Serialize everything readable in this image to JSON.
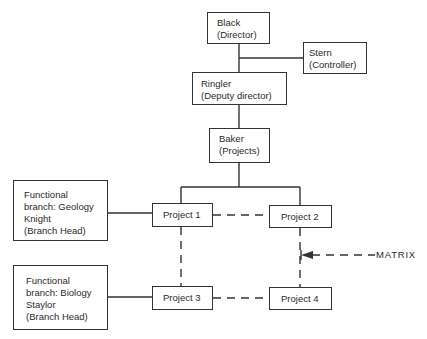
{
  "diagram": {
    "type": "organization-chart-matrix",
    "nodes": {
      "director": {
        "name": "Black",
        "role": "(Director)"
      },
      "controller": {
        "name": "Stern",
        "role": "(Controller)"
      },
      "deputy": {
        "name": "Ringler",
        "role": "(Deputy director)"
      },
      "projects_head": {
        "name": "Baker",
        "role": "(Projects)"
      },
      "geology": {
        "line1": "Functional",
        "line2": "branch: Geology",
        "line3": "Knight",
        "line4": "(Branch Head)"
      },
      "biology": {
        "line1": "Functional",
        "line2": "branch: Biology",
        "line3": "Staylor",
        "line4": "(Branch Head)"
      },
      "project1": {
        "label": "Project 1"
      },
      "project2": {
        "label": "Project 2"
      },
      "project3": {
        "label": "Project 3"
      },
      "project4": {
        "label": "Project 4"
      }
    },
    "annotation": {
      "label": "MATRIX"
    },
    "colors": {
      "line": "#333333",
      "text": "#2a2a2a",
      "background": "#ffffff"
    }
  }
}
